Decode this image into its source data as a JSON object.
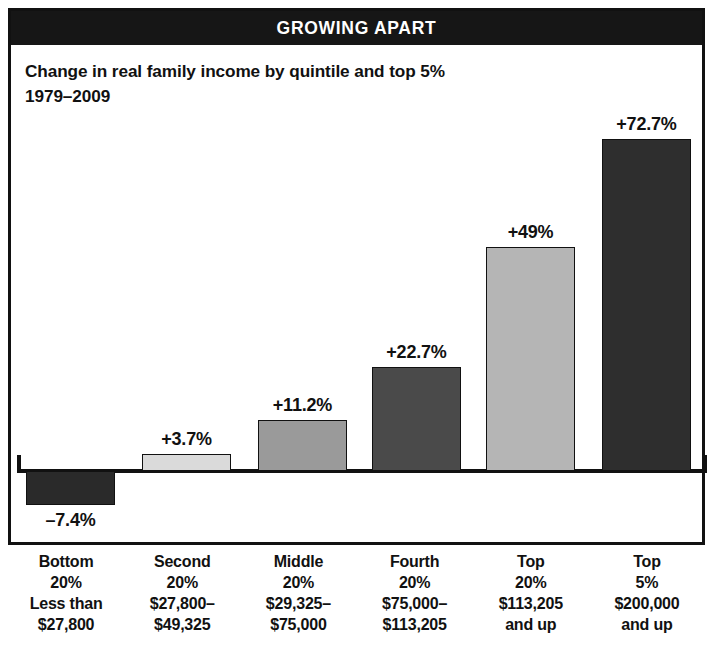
{
  "banner": {
    "title": "GROWING APART"
  },
  "subtitle": {
    "line1": "Change in real family income by quintile and top 5%",
    "line2": "1979–2009"
  },
  "colors": {
    "frame": "#111111",
    "banner_background": "#161616",
    "banner_text": "#ffffff",
    "page_background": "#ffffff",
    "bar_bottom20": "#2a2a2a",
    "bar_second20": "#dadada",
    "bar_middle20": "#9a9a9a",
    "bar_fourth20": "#4a4a4a",
    "bar_top20": "#b5b5b5",
    "bar_top5": "#2e2e2e"
  },
  "chart_data": {
    "type": "bar",
    "title": "GROWING APART",
    "subtitle": "Change in real family income by quintile and top 5% 1979–2009",
    "xlabel": "",
    "ylabel": "",
    "ylim": [
      -10,
      80
    ],
    "grid": false,
    "legend": "none",
    "categories": [
      "Bottom 20%",
      "Second 20%",
      "Middle 20%",
      "Fourth 20%",
      "Top 20%",
      "Top 5%"
    ],
    "values": [
      -7.4,
      3.7,
      11.2,
      22.7,
      49,
      72.7
    ],
    "value_labels": [
      "–7.4%",
      "+3.7%",
      "+11.2%",
      "+22.7%",
      "+49%",
      "+72.7%"
    ],
    "bar_colors": [
      "#2a2a2a",
      "#dadada",
      "#9a9a9a",
      "#4a4a4a",
      "#b5b5b5",
      "#2e2e2e"
    ],
    "category_detail": [
      {
        "name": "Bottom",
        "share": "20%",
        "range_line1": "Less than",
        "range_line2": "$27,800"
      },
      {
        "name": "Second",
        "share": "20%",
        "range_line1": "$27,800–",
        "range_line2": "$49,325"
      },
      {
        "name": "Middle",
        "share": "20%",
        "range_line1": "$29,325–",
        "range_line2": "$75,000"
      },
      {
        "name": "Fourth",
        "share": "20%",
        "range_line1": "$75,000–",
        "range_line2": "$113,205"
      },
      {
        "name": "Top",
        "share": "20%",
        "range_line1": "$113,205",
        "range_line2": "and up"
      },
      {
        "name": "Top",
        "share": "5%",
        "range_line1": "$200,000",
        "range_line2": "and up"
      }
    ]
  }
}
